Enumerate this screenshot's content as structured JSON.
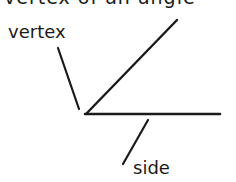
{
  "diagram": {
    "clipped_heading": "vertex of an angle",
    "labels": {
      "vertex": "vertex",
      "side": "side"
    },
    "geometry": {
      "vertex_point": [
        86,
        114
      ],
      "ray_horizontal_end": [
        220,
        114
      ],
      "ray_diagonal_end": [
        177,
        20
      ],
      "vertex_pointer": [
        [
          58,
          48
        ],
        [
          80,
          110
        ]
      ],
      "side_pointer": [
        [
          148,
          120
        ],
        [
          123,
          164
        ]
      ]
    },
    "colors": {
      "stroke": "#1a1a1a",
      "background": "#ffffff"
    }
  }
}
